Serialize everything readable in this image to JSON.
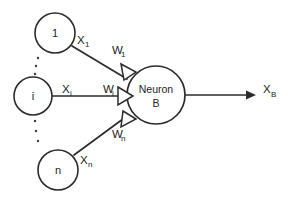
{
  "diagram": {
    "type": "neural-network-neuron",
    "input_nodes": [
      {
        "id": "input-1",
        "label": "1",
        "signal_base": "X",
        "signal_sub": "1",
        "weight_base": "W",
        "weight_sub": "1"
      },
      {
        "id": "input-i",
        "label": "i",
        "signal_base": "X",
        "signal_sub": "i",
        "weight_base": "W",
        "weight_sub": "i"
      },
      {
        "id": "input-n",
        "label": "n",
        "signal_base": "X",
        "signal_sub": "n",
        "weight_base": "W",
        "weight_sub": "n"
      }
    ],
    "neuron": {
      "line1": "Neuron",
      "line2": "B"
    },
    "output": {
      "base": "X",
      "sub": "B"
    },
    "ellipsis": {
      "upper_dots": 3,
      "lower_dots": 3
    },
    "colors": {
      "stroke": "#2b2b2b",
      "fill": "#ffffff",
      "text": "#1c1c1c",
      "background": "#ffffff"
    }
  }
}
